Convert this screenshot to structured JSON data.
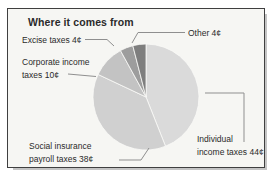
{
  "title": "Where it comes from",
  "chart_data": {
    "type": "pie",
    "title": "Where it comes from",
    "unit": "¢",
    "total": 100,
    "start_at": "12-oclock",
    "direction": "clockwise",
    "legend_position": "callout-labels",
    "slices": [
      {
        "name": "Individual income taxes",
        "label": "Individual income taxes 44¢",
        "value": 44,
        "color": "#dadada"
      },
      {
        "name": "Social insurance payroll taxes",
        "label": "Social insurance payroll taxes 38¢",
        "value": 38,
        "color": "#d0d0d0"
      },
      {
        "name": "Corporate income taxes",
        "label": "Corporate income taxes 10¢",
        "value": 10,
        "color": "#c3c3c3"
      },
      {
        "name": "Excise taxes",
        "label": "Excise taxes 4¢",
        "value": 4,
        "color": "#9d9d9d"
      },
      {
        "name": "Other",
        "label": "Other 4¢",
        "value": 4,
        "color": "#7e7e7e"
      }
    ]
  },
  "callouts": {
    "excise": {
      "line1": "Excise taxes 4¢"
    },
    "corporate": {
      "line1": "Corporate income",
      "line2": "taxes 10¢"
    },
    "other": {
      "line1": "Other 4¢"
    },
    "social": {
      "line1": "Social insurance",
      "line2": "payroll taxes 38¢"
    },
    "individual": {
      "line1": "Individual",
      "line2": "income taxes 44¢"
    }
  },
  "colors": {
    "card_background": "#f6f6f3",
    "card_border": "#3f3f3f",
    "card_shadow": "#c4c4c4",
    "leader_line": "#8f8f8f",
    "text": "#2a2a2a",
    "slice_separator": "#fafaf8"
  }
}
